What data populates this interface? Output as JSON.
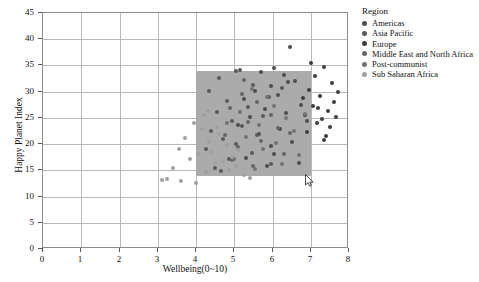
{
  "chart_data": {
    "type": "scatter",
    "title": "",
    "xlabel": "Wellbeing(0~10)",
    "ylabel": "Happy Planet Index",
    "xlim": [
      0,
      8
    ],
    "ylim": [
      0,
      45
    ],
    "xticks": [
      0,
      1,
      2,
      3,
      4,
      5,
      6,
      7,
      8
    ],
    "yticks": [
      0,
      5,
      10,
      15,
      20,
      25,
      30,
      35,
      40,
      45
    ],
    "grid": true,
    "legend_position": "right",
    "legend_title": "Region",
    "selection_rect": {
      "x0": 4.0,
      "x1": 7.0,
      "y0": 14.0,
      "y1": 34.0,
      "color": "#a6a6a6"
    },
    "series": [
      {
        "name": "Americas",
        "color": "#4d4d4d",
        "points": [
          [
            6.45,
            38.5
          ],
          [
            6.05,
            34.6
          ],
          [
            6.3,
            33.2
          ],
          [
            5.95,
            31.1
          ],
          [
            6.6,
            32.0
          ],
          [
            5.55,
            30.2
          ],
          [
            6.15,
            29.4
          ],
          [
            5.25,
            28.6
          ],
          [
            6.75,
            27.5
          ],
          [
            5.8,
            26.7
          ],
          [
            6.35,
            26.0
          ],
          [
            5.4,
            25.2
          ],
          [
            6.9,
            24.4
          ],
          [
            5.1,
            23.6
          ],
          [
            6.2,
            22.8
          ],
          [
            5.65,
            21.9
          ],
          [
            6.5,
            20.4
          ],
          [
            5.95,
            19.6
          ],
          [
            6.05,
            18.2
          ],
          [
            5.3,
            17.4
          ],
          [
            6.7,
            16.5
          ],
          [
            5.85,
            15.8
          ],
          [
            6.4,
            31.8
          ],
          [
            5.7,
            33.8
          ]
        ]
      },
      {
        "name": "Asia Pacific",
        "color": "#595959",
        "points": [
          [
            5.05,
            33.9
          ],
          [
            4.6,
            32.6
          ],
          [
            5.5,
            31.2
          ],
          [
            4.35,
            30.1
          ],
          [
            5.9,
            29.0
          ],
          [
            4.8,
            28.2
          ],
          [
            5.35,
            27.0
          ],
          [
            4.55,
            26.2
          ],
          [
            5.75,
            25.4
          ],
          [
            4.95,
            24.5
          ],
          [
            5.2,
            23.4
          ],
          [
            4.4,
            22.6
          ],
          [
            5.6,
            21.8
          ],
          [
            4.7,
            20.9
          ],
          [
            5.05,
            20.0
          ],
          [
            4.25,
            19.0
          ],
          [
            5.45,
            18.3
          ],
          [
            4.85,
            17.2
          ],
          [
            5.95,
            16.3
          ],
          [
            4.5,
            15.4
          ],
          [
            6.25,
            30.8
          ],
          [
            5.15,
            34.2
          ],
          [
            4.65,
            14.9
          ]
        ]
      },
      {
        "name": "Europe",
        "color": "#3d3d3d",
        "points": [
          [
            7.35,
            34.8
          ],
          [
            7.1,
            33.0
          ],
          [
            7.55,
            31.6
          ],
          [
            6.95,
            30.4
          ],
          [
            7.25,
            29.2
          ],
          [
            7.6,
            28.0
          ],
          [
            7.05,
            27.2
          ],
          [
            7.45,
            26.4
          ],
          [
            6.85,
            25.6
          ],
          [
            7.3,
            24.8
          ],
          [
            7.15,
            24.0
          ],
          [
            7.5,
            23.2
          ],
          [
            6.9,
            22.4
          ],
          [
            7.4,
            21.6
          ],
          [
            7.2,
            26.9
          ],
          [
            7.65,
            25.1
          ],
          [
            7.0,
            35.4
          ],
          [
            7.7,
            30.0
          ],
          [
            6.8,
            28.8
          ],
          [
            7.35,
            20.8
          ]
        ]
      },
      {
        "name": "Middle East and North Africa",
        "color": "#666666",
        "points": [
          [
            5.2,
            29.6
          ],
          [
            5.6,
            28.1
          ],
          [
            4.9,
            26.8
          ],
          [
            5.95,
            25.5
          ],
          [
            5.35,
            24.2
          ],
          [
            6.15,
            23.0
          ],
          [
            4.75,
            21.8
          ],
          [
            5.7,
            20.6
          ],
          [
            5.1,
            19.4
          ],
          [
            6.3,
            18.2
          ],
          [
            4.95,
            17.0
          ],
          [
            5.5,
            15.9
          ],
          [
            6.45,
            22.2
          ],
          [
            5.25,
            32.2
          ]
        ]
      },
      {
        "name": "Post-communist",
        "color": "#737373",
        "points": [
          [
            5.45,
            30.6
          ],
          [
            5.85,
            28.9
          ],
          [
            6.05,
            27.3
          ],
          [
            5.15,
            26.1
          ],
          [
            6.35,
            24.9
          ],
          [
            5.65,
            23.7
          ],
          [
            6.55,
            22.5
          ],
          [
            5.3,
            21.3
          ],
          [
            6.1,
            20.2
          ],
          [
            5.75,
            19.1
          ],
          [
            6.7,
            18.0
          ],
          [
            5.0,
            17.1
          ],
          [
            6.25,
            16.2
          ],
          [
            5.55,
            15.3
          ],
          [
            6.85,
            25.8
          ],
          [
            4.8,
            24.0
          ]
        ]
      },
      {
        "name": "Sub Saharan Africa",
        "color": "#a0a0a0",
        "points": [
          [
            3.95,
            24.0
          ],
          [
            4.15,
            22.8
          ],
          [
            3.7,
            21.2
          ],
          [
            4.35,
            20.4
          ],
          [
            3.55,
            19.0
          ],
          [
            4.05,
            18.2
          ],
          [
            3.85,
            17.2
          ],
          [
            4.5,
            16.4
          ],
          [
            3.4,
            15.5
          ],
          [
            4.25,
            14.6
          ],
          [
            3.25,
            13.4
          ],
          [
            3.6,
            13.0
          ],
          [
            4.6,
            21.9
          ],
          [
            4.8,
            19.8
          ],
          [
            4.4,
            18.6
          ],
          [
            4.95,
            17.6
          ],
          [
            4.7,
            16.8
          ],
          [
            5.05,
            15.9
          ],
          [
            4.85,
            15.0
          ],
          [
            5.25,
            14.2
          ],
          [
            4.2,
            25.6
          ],
          [
            3.1,
            13.2
          ],
          [
            4.0,
            12.6
          ],
          [
            5.4,
            13.6
          ],
          [
            4.55,
            23.2
          ],
          [
            5.1,
            18.9
          ],
          [
            4.3,
            26.4
          ]
        ]
      }
    ]
  },
  "legend": {
    "title": "Region",
    "items": [
      {
        "label": "Americas",
        "color": "#4d4d4d"
      },
      {
        "label": "Asia Pacific",
        "color": "#595959"
      },
      {
        "label": "Europe",
        "color": "#3d3d3d"
      },
      {
        "label": "Middle East and North Africa",
        "color": "#666666"
      },
      {
        "label": "Post-communist",
        "color": "#737373"
      },
      {
        "label": "Sub Saharan Africa",
        "color": "#a0a0a0"
      }
    ]
  }
}
